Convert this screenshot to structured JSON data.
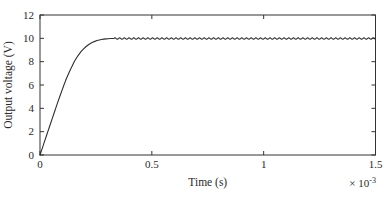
{
  "figure": {
    "background": "#ffffff",
    "axis_color": "#333333"
  },
  "chart_data": {
    "type": "line",
    "title": "",
    "xlabel": "Time (s)",
    "ylabel": "Output voltage (V)",
    "x_multiplier": {
      "base": "× 10",
      "exponent": "-3"
    },
    "xlim": [
      0,
      1.5
    ],
    "ylim": [
      0,
      12
    ],
    "grid": false,
    "legend": false,
    "box": true,
    "x_ticks": [
      {
        "value": 0,
        "label": "0"
      },
      {
        "value": 0.5,
        "label": "0.5"
      },
      {
        "value": 1,
        "label": "1"
      },
      {
        "value": 1.5,
        "label": "1.5"
      }
    ],
    "y_ticks": [
      {
        "value": 0,
        "label": "0"
      },
      {
        "value": 2,
        "label": "2"
      },
      {
        "value": 4,
        "label": "4"
      },
      {
        "value": 6,
        "label": "6"
      },
      {
        "value": 8,
        "label": "8"
      },
      {
        "value": 10,
        "label": "10"
      },
      {
        "value": 12,
        "label": "12"
      }
    ],
    "series": [
      {
        "name": "output_voltage",
        "color": "#2e2e2e",
        "rise_points": [
          [
            0.0,
            0.0
          ],
          [
            0.01,
            0.57
          ],
          [
            0.02,
            1.14
          ],
          [
            0.03,
            1.71
          ],
          [
            0.035,
            2.0
          ],
          [
            0.045,
            2.57
          ],
          [
            0.055,
            3.14
          ],
          [
            0.065,
            3.71
          ],
          [
            0.07,
            4.0
          ],
          [
            0.08,
            4.55
          ],
          [
            0.09,
            5.1
          ],
          [
            0.1,
            5.62
          ],
          [
            0.107,
            6.0
          ],
          [
            0.115,
            6.4
          ],
          [
            0.125,
            6.85
          ],
          [
            0.135,
            7.28
          ],
          [
            0.145,
            7.67
          ],
          [
            0.153,
            8.0
          ],
          [
            0.165,
            8.38
          ],
          [
            0.175,
            8.65
          ],
          [
            0.185,
            8.9
          ],
          [
            0.195,
            9.1
          ],
          [
            0.205,
            9.28
          ],
          [
            0.215,
            9.43
          ],
          [
            0.225,
            9.56
          ],
          [
            0.235,
            9.66
          ],
          [
            0.245,
            9.74
          ],
          [
            0.255,
            9.81
          ],
          [
            0.265,
            9.86
          ],
          [
            0.275,
            9.9
          ],
          [
            0.285,
            9.93
          ],
          [
            0.295,
            9.95
          ],
          [
            0.305,
            9.97
          ],
          [
            0.315,
            9.98
          ],
          [
            0.33,
            9.98
          ]
        ],
        "steady_state": {
          "start": 0.33,
          "end": 1.5,
          "value": 9.98,
          "ripple_amplitude": 0.06,
          "ripple_period": 0.021
        }
      }
    ]
  }
}
